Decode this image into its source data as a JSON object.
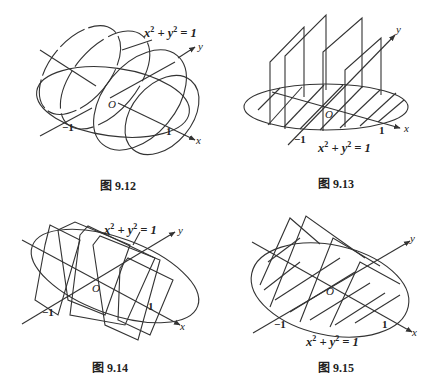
{
  "figures": [
    {
      "id": "fig-9-12",
      "caption": "图 9.12",
      "equation": {
        "x": "x",
        "y": "y",
        "exp": "2",
        "plus": "+",
        "eq": "= 1"
      },
      "axis_x": "x",
      "axis_y": "y",
      "origin": "O",
      "tick_neg": "−1",
      "tick_pos": "1"
    },
    {
      "id": "fig-9-13",
      "caption": "图 9.13",
      "equation": {
        "x": "x",
        "y": "y",
        "exp": "2",
        "plus": "+",
        "eq": "= 1"
      },
      "axis_x": "x",
      "axis_y": "y",
      "origin": "O",
      "tick_neg": "−1",
      "tick_pos": "1"
    },
    {
      "id": "fig-9-14",
      "caption": "图 9.14",
      "equation": {
        "x": "x",
        "y": "y",
        "exp": "2",
        "plus": "+",
        "eq": "= 1"
      },
      "axis_x": "x",
      "axis_y": "y",
      "origin": "O",
      "tick_neg": "−1",
      "tick_pos": "1"
    },
    {
      "id": "fig-9-15",
      "caption": "图 9.15",
      "equation": {
        "x": "x",
        "y": "y",
        "exp": "2",
        "plus": "+",
        "eq": "= 1"
      },
      "axis_x": "x",
      "axis_y": "y",
      "origin": "O",
      "tick_neg": "−1",
      "tick_pos": "1"
    }
  ],
  "colors": {
    "stroke": "#333333",
    "background": "#ffffff"
  }
}
